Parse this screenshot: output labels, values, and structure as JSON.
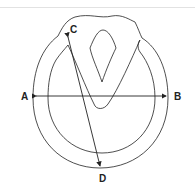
{
  "diagram": {
    "labels": {
      "a": "A",
      "b": "B",
      "c": "C",
      "d": "D"
    },
    "lines": [
      {
        "from": "A",
        "to": "B",
        "arrows": "both",
        "orientation": "horizontal"
      },
      {
        "from": "C",
        "to": "D",
        "arrows": "both",
        "orientation": "diagonal"
      }
    ],
    "colors": {
      "stroke": "#222222",
      "background": "#ffffff",
      "divider": "#e2e2e2"
    }
  }
}
